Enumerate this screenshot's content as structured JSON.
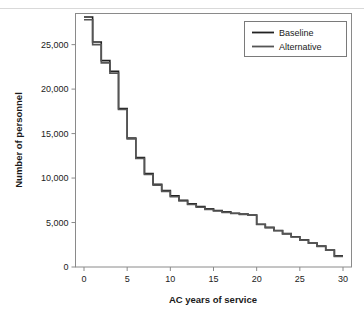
{
  "chart_data": {
    "type": "line",
    "subtype": "step",
    "title": "",
    "xlabel": "AC years of service",
    "ylabel": "Number of personnel",
    "xlim": [
      0,
      30
    ],
    "ylim": [
      0,
      28500
    ],
    "xticks": [
      0,
      5,
      10,
      15,
      20,
      25,
      30
    ],
    "xtick_labels": [
      "0",
      "5",
      "10",
      "15",
      "20",
      "25",
      "30"
    ],
    "yticks": [
      0,
      5000,
      10000,
      15000,
      20000,
      25000
    ],
    "ytick_labels": [
      "0",
      "5,000",
      "10,000",
      "15,000",
      "20,000",
      "25,000"
    ],
    "grid": false,
    "legend_position": "top-right",
    "x": [
      0,
      1,
      2,
      3,
      4,
      5,
      6,
      7,
      8,
      9,
      10,
      11,
      12,
      13,
      14,
      15,
      16,
      17,
      18,
      19,
      20,
      21,
      22,
      23,
      24,
      25,
      26,
      27,
      28,
      29,
      30
    ],
    "series": [
      {
        "name": "Baseline",
        "color": "#222222",
        "values": [
          28100,
          28100,
          25300,
          23200,
          22000,
          17800,
          14500,
          12300,
          10500,
          9300,
          8600,
          8000,
          7500,
          7100,
          6800,
          6550,
          6350,
          6200,
          6050,
          5950,
          5850,
          4800,
          4450,
          4100,
          3750,
          3400,
          3050,
          2700,
          2350,
          1900,
          1250
        ]
      },
      {
        "name": "Alternative",
        "color": "#555555",
        "values": [
          27800,
          27800,
          25000,
          22950,
          21800,
          17700,
          14400,
          12200,
          10400,
          9200,
          8500,
          7900,
          7420,
          7020,
          6720,
          6480,
          6290,
          6140,
          6010,
          5920,
          5820,
          4780,
          4420,
          4070,
          3720,
          3370,
          3020,
          2670,
          2320,
          1880,
          1200
        ]
      }
    ]
  },
  "legend": {
    "items": [
      {
        "label": "Baseline"
      },
      {
        "label": "Alternative"
      }
    ]
  }
}
